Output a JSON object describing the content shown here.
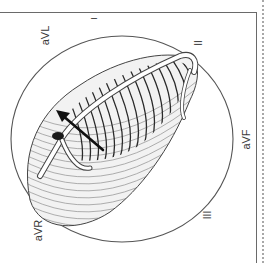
{
  "figure": {
    "leads": {
      "I": "I",
      "II": "II",
      "III": "III",
      "aVR": "aVR",
      "aVL": "aVL",
      "aVF": "aVF"
    },
    "colors": {
      "line": "#555555",
      "dark_hatch": "#2a2a2a",
      "light_hatch": "#9a9a9a",
      "arrow": "#111111",
      "background": "#ffffff"
    }
  }
}
